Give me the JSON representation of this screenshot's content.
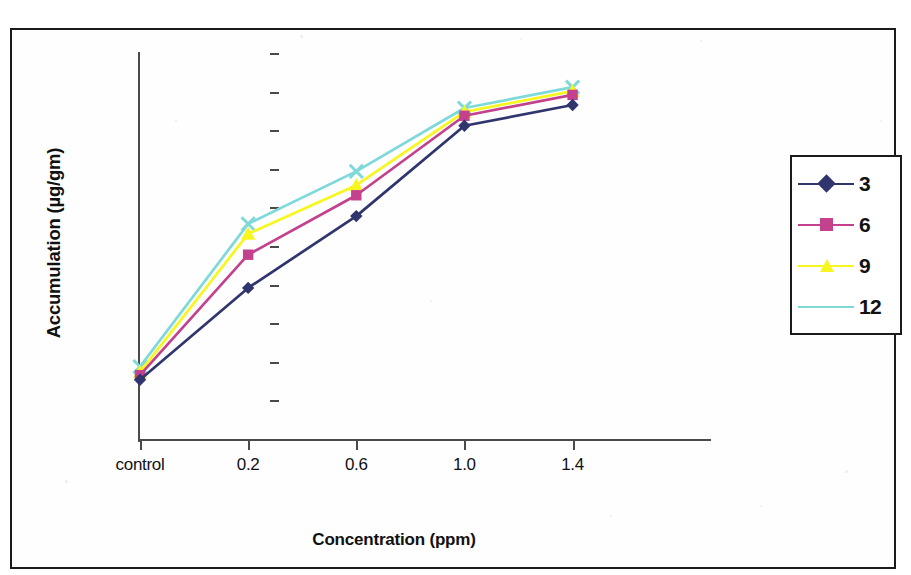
{
  "chart_data": {
    "type": "line",
    "title": "",
    "xlabel": "Concentration (ppm)",
    "ylabel": "Accumulation (µg/gm)",
    "categories": [
      "control",
      "0.2",
      "0.6",
      "1.0",
      "1.4"
    ],
    "ylim": [
      0,
      500
    ],
    "yticks": [
      0,
      50,
      100,
      150,
      200,
      250,
      300,
      350,
      400,
      450,
      500
    ],
    "ytick_labels": [
      "0",
      "50",
      "100",
      "150",
      "200",
      "250",
      "300",
      "350",
      "400",
      "450",
      "500"
    ],
    "grid": false,
    "legend_position": "right",
    "series": [
      {
        "name": "3",
        "values": [
          78,
          197,
          290,
          407,
          434
        ],
        "color": "#31356e",
        "marker": "diamond"
      },
      {
        "name": "6",
        "values": [
          84,
          240,
          317,
          420,
          447
        ],
        "color": "#c4418e",
        "marker": "square"
      },
      {
        "name": "9",
        "values": [
          88,
          267,
          330,
          425,
          452
        ],
        "color": "#f7f71f",
        "marker": "triangle"
      },
      {
        "name": "12",
        "values": [
          95,
          280,
          348,
          430,
          457
        ],
        "color": "#7fd9da",
        "marker": "cross"
      }
    ]
  },
  "legend": {
    "entries": [
      {
        "label": "3"
      },
      {
        "label": "6"
      },
      {
        "label": "9"
      },
      {
        "label": "12"
      }
    ]
  }
}
